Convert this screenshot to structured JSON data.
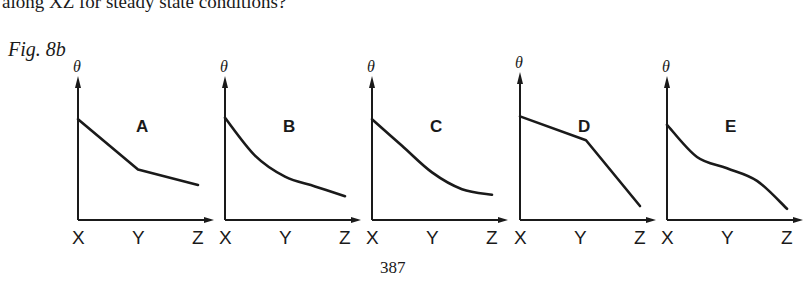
{
  "text": {
    "question_tail": "along XZ for steady state conditions?",
    "figure_label": "Fig. 8b",
    "page_number": "387"
  },
  "chart_data": {
    "type": "line",
    "title": "Fig. 8b",
    "ylabel": "θ",
    "x_ticks": [
      "X",
      "Y",
      "Z"
    ],
    "panels": [
      {
        "label": "A",
        "shape": "straight segments: steeper X→Y, shallower Y→Z",
        "points": [
          [
            0,
            0.72
          ],
          [
            0.5,
            0.36
          ],
          [
            1,
            0.25
          ]
        ],
        "curved": false
      },
      {
        "label": "B",
        "shape": "smooth concave-up decay",
        "points": [
          [
            0,
            0.73
          ],
          [
            0.25,
            0.46
          ],
          [
            0.5,
            0.31
          ],
          [
            0.75,
            0.24
          ],
          [
            1,
            0.17
          ]
        ],
        "curved": true
      },
      {
        "label": "C",
        "shape": "straight X→Y then curving flatter to Z",
        "points": [
          [
            0,
            0.72
          ],
          [
            0.25,
            0.53
          ],
          [
            0.5,
            0.34
          ],
          [
            0.75,
            0.22
          ],
          [
            1,
            0.18
          ]
        ],
        "curved": true
      },
      {
        "label": "D",
        "shape": "straight segments: shallow X→Y, steeper Y→Z",
        "points": [
          [
            0,
            0.74
          ],
          [
            0.55,
            0.57
          ],
          [
            1,
            0.1
          ]
        ],
        "curved": false
      },
      {
        "label": "E",
        "shape": "decreasing S-curve with inflection near Y",
        "points": [
          [
            0,
            0.68
          ],
          [
            0.25,
            0.45
          ],
          [
            0.5,
            0.37
          ],
          [
            0.75,
            0.28
          ],
          [
            1,
            0.08
          ]
        ],
        "curved": true
      }
    ]
  }
}
